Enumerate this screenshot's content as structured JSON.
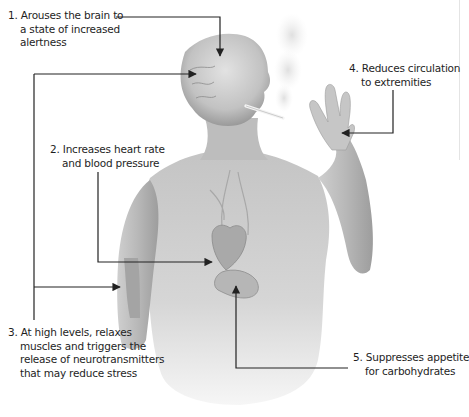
{
  "figure": {
    "colors": {
      "text": "#1e1e1e",
      "connector": "#222222",
      "skin_light": "#d8d8d8",
      "skin_mid": "#b4b4b4",
      "skin_dark": "#8a8a8a",
      "smoke": "#e6e6e6",
      "background": "#ffffff"
    },
    "callouts": [
      {
        "number": "1.",
        "lines": [
          "Arouses the brain to",
          "a state of increased",
          "alertness"
        ],
        "target": "brain"
      },
      {
        "number": "2.",
        "lines": [
          "Increases heart rate",
          "and blood pressure"
        ],
        "target": "heart"
      },
      {
        "number": "3.",
        "lines": [
          "At high levels, relaxes",
          "muscles and triggers the",
          "release of neurotransmitters",
          "that may reduce stress"
        ],
        "target": "brain-and-arm-muscle"
      },
      {
        "number": "4.",
        "lines": [
          "Reduces circulation",
          "to extremities"
        ],
        "target": "hand"
      },
      {
        "number": "5.",
        "lines": [
          "Suppresses appetite",
          "for carbohydrates"
        ],
        "target": "stomach"
      }
    ]
  }
}
